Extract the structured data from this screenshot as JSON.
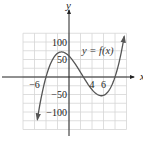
{
  "chart_data": {
    "type": "line",
    "title": "",
    "xlabel": "x",
    "ylabel": "y",
    "function_label": "y = f(x)",
    "xlim": [
      -8,
      10
    ],
    "ylim": [
      -130,
      130
    ],
    "grid": true,
    "grid_x_range": [
      -8,
      10
    ],
    "grid_y_range": [
      -150,
      125
    ],
    "x_grid_step": 2,
    "y_grid_step": 25,
    "x_ticks": [
      {
        "value": -6,
        "label": "-6"
      },
      {
        "value": 4,
        "label": "4"
      },
      {
        "value": 6,
        "label": "6"
      }
    ],
    "y_ticks": [
      {
        "value": 100,
        "label": "100"
      },
      {
        "value": 50,
        "label": "50"
      },
      {
        "value": -50,
        "label": "-50"
      },
      {
        "value": -100,
        "label": "-100"
      }
    ],
    "series": [
      {
        "name": "f(x)",
        "description": "cubic curve, arrows at both ends",
        "roots": [
          -4,
          2.5,
          8
        ],
        "y_intercept": 60,
        "local_max": {
          "x": -2,
          "y": 68
        },
        "local_min": {
          "x": 5.5,
          "y": -53
        },
        "x_start": -5.5,
        "x_end": 9.6
      }
    ],
    "colors": {
      "curve": "#555555",
      "axis": "#222222",
      "grid": "#d6d6d6"
    }
  }
}
